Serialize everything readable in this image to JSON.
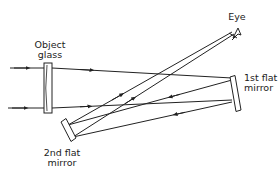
{
  "diagram": {
    "title": "",
    "labels": {
      "object_glass_line1": "Object",
      "object_glass_line2": "glass",
      "eye": "Eye",
      "first_mirror_line1": "1st flat",
      "first_mirror_line2": "mirror",
      "second_mirror_line1": "2nd flat",
      "second_mirror_line2": "mirror"
    },
    "components": [
      "object glass (lens)",
      "1st flat mirror",
      "2nd flat mirror",
      "eye"
    ],
    "colors": {
      "line": "#222222",
      "background": "#ffffff"
    }
  }
}
